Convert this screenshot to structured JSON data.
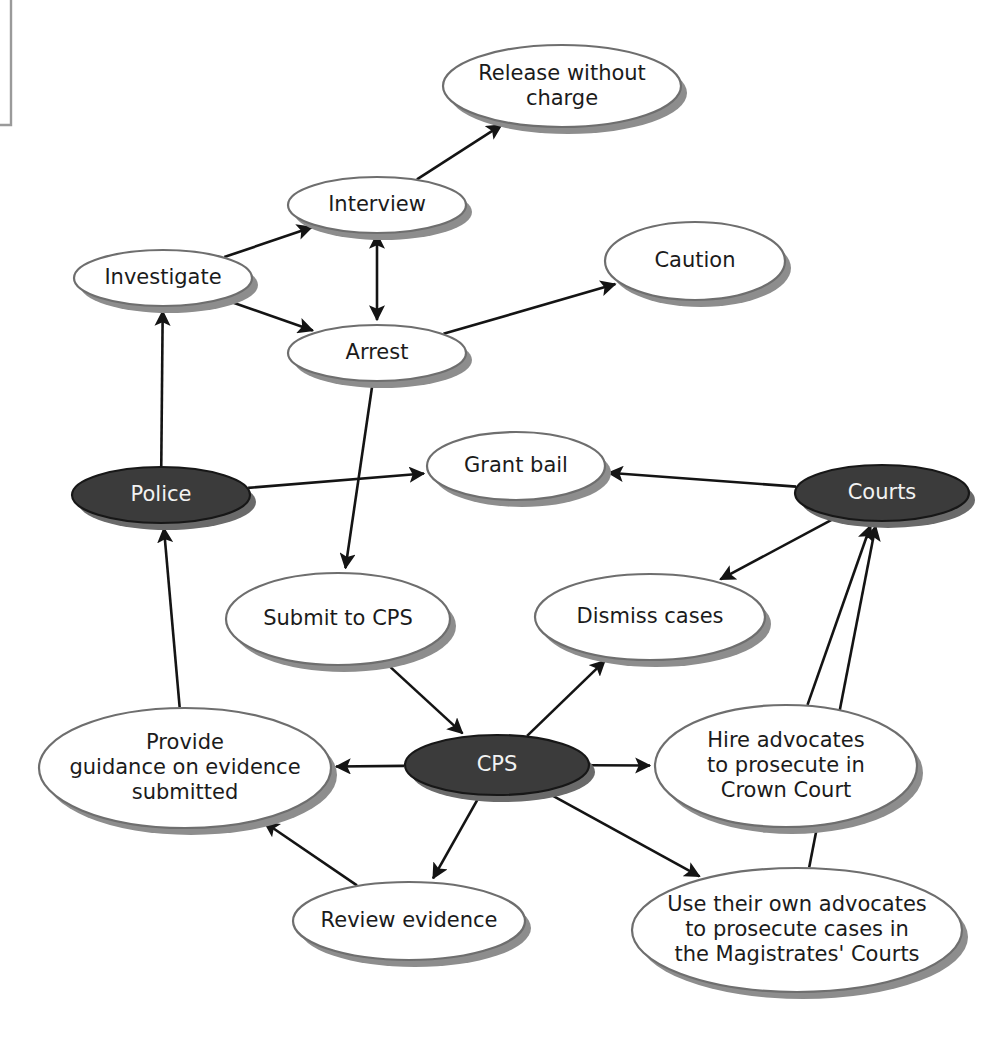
{
  "diagram": {
    "colors": {
      "background": "#ffffff",
      "node_fill_plain": "#ffffff",
      "node_fill_actor": "#3b3b3b",
      "node_stroke": "#6e6e6e",
      "node_shadow": "#8d8d8d",
      "label_color": "#1b1b1b",
      "label_color_inverted": "#f2f2f2",
      "edge_color": "#141414",
      "page_frame": "#9a9a9a"
    },
    "nodes": [
      {
        "id": "release",
        "label_lines": [
          "Release without",
          "charge"
        ],
        "style": "plain",
        "cx": 562,
        "cy": 86,
        "rx": 119,
        "ry": 41
      },
      {
        "id": "interview",
        "label_lines": [
          "Interview"
        ],
        "style": "plain",
        "cx": 377,
        "cy": 205,
        "rx": 89,
        "ry": 28
      },
      {
        "id": "caution",
        "label_lines": [
          "Caution"
        ],
        "style": "plain",
        "cx": 695,
        "cy": 261,
        "rx": 90,
        "ry": 39
      },
      {
        "id": "investigate",
        "label_lines": [
          "Investigate"
        ],
        "style": "plain",
        "cx": 163,
        "cy": 278,
        "rx": 89,
        "ry": 28
      },
      {
        "id": "arrest",
        "label_lines": [
          "Arrest"
        ],
        "style": "plain",
        "cx": 377,
        "cy": 353,
        "rx": 89,
        "ry": 28
      },
      {
        "id": "grant_bail",
        "label_lines": [
          "Grant bail"
        ],
        "style": "plain",
        "cx": 516,
        "cy": 466,
        "rx": 89,
        "ry": 34
      },
      {
        "id": "police",
        "label_lines": [
          "Police"
        ],
        "style": "actor",
        "cx": 161,
        "cy": 495,
        "rx": 89,
        "ry": 28
      },
      {
        "id": "courts",
        "label_lines": [
          "Courts"
        ],
        "style": "actor",
        "cx": 882,
        "cy": 493,
        "rx": 87,
        "ry": 28
      },
      {
        "id": "submit_cps",
        "label_lines": [
          "Submit to CPS"
        ],
        "style": "plain",
        "cx": 338,
        "cy": 619,
        "rx": 112,
        "ry": 46
      },
      {
        "id": "dismiss",
        "label_lines": [
          "Dismiss cases"
        ],
        "style": "plain",
        "cx": 650,
        "cy": 617,
        "rx": 115,
        "ry": 43
      },
      {
        "id": "hire_advocates",
        "label_lines": [
          "Hire advocates",
          "to prosecute in",
          "Crown Court"
        ],
        "style": "plain",
        "cx": 786,
        "cy": 766,
        "rx": 131,
        "ry": 61
      },
      {
        "id": "provide_guidance",
        "label_lines": [
          "Provide",
          "guidance on evidence",
          "submitted"
        ],
        "style": "plain",
        "cx": 185,
        "cy": 768,
        "rx": 146,
        "ry": 60
      },
      {
        "id": "cps",
        "label_lines": [
          "CPS"
        ],
        "style": "actor",
        "cx": 497,
        "cy": 765,
        "rx": 92,
        "ry": 30
      },
      {
        "id": "review_evidence",
        "label_lines": [
          "Review evidence"
        ],
        "style": "plain",
        "cx": 409,
        "cy": 921,
        "rx": 116,
        "ry": 39
      },
      {
        "id": "use_own_advocates",
        "label_lines": [
          "Use their own advocates",
          "to prosecute cases in",
          "the Magistrates' Courts"
        ],
        "style": "plain",
        "cx": 797,
        "cy": 930,
        "rx": 165,
        "ry": 62
      }
    ],
    "edges": [
      {
        "from": "investigate",
        "to": "interview",
        "arrow": "end"
      },
      {
        "from": "investigate",
        "to": "arrest",
        "arrow": "end"
      },
      {
        "from": "interview",
        "to": "release",
        "arrow": "end"
      },
      {
        "from": "interview",
        "to": "arrest",
        "arrow": "both"
      },
      {
        "from": "arrest",
        "to": "caution",
        "arrow": "end"
      },
      {
        "from": "arrest",
        "to": "submit_cps",
        "arrow": "end"
      },
      {
        "from": "police",
        "to": "investigate",
        "arrow": "end"
      },
      {
        "from": "police",
        "to": "grant_bail",
        "arrow": "end"
      },
      {
        "from": "provide_guidance",
        "to": "police",
        "arrow": "end"
      },
      {
        "from": "courts",
        "to": "grant_bail",
        "arrow": "end"
      },
      {
        "from": "courts",
        "to": "dismiss",
        "arrow": "end"
      },
      {
        "from": "submit_cps",
        "to": "cps",
        "arrow": "end"
      },
      {
        "from": "cps",
        "to": "dismiss",
        "arrow": "end"
      },
      {
        "from": "cps",
        "to": "provide_guidance",
        "arrow": "end"
      },
      {
        "from": "cps",
        "to": "review_evidence",
        "arrow": "end"
      },
      {
        "from": "cps",
        "to": "hire_advocates",
        "arrow": "end"
      },
      {
        "from": "cps",
        "to": "use_own_advocates",
        "arrow": "end"
      },
      {
        "from": "review_evidence",
        "to": "provide_guidance",
        "arrow": "end"
      },
      {
        "from": "hire_advocates",
        "to": "courts",
        "arrow": "end"
      },
      {
        "from": "use_own_advocates",
        "to": "courts",
        "arrow": "end"
      }
    ]
  }
}
